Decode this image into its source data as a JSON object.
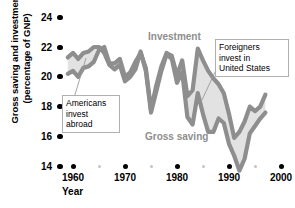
{
  "chart_data": {
    "type": "line",
    "title": "",
    "xlabel": "Year",
    "ylabel": "Gross saving and investment (percentage of GNP)",
    "xlim": [
      1958,
      2000
    ],
    "ylim": [
      14,
      24
    ],
    "yticks": [
      14,
      16,
      18,
      20,
      22,
      24
    ],
    "xticks": [
      1960,
      1970,
      1980,
      1990,
      2000
    ],
    "xticks_minor": [
      1965,
      1975,
      1985,
      1995
    ],
    "grid": false,
    "legend_position": "inline-annotations",
    "series": [
      {
        "name": "Investment",
        "color": "#8e8e8e",
        "x": [
          1959,
          1960,
          1961,
          1962,
          1963,
          1964,
          1965,
          1966,
          1967,
          1968,
          1969,
          1970,
          1971,
          1972,
          1973,
          1974,
          1975,
          1976,
          1977,
          1978,
          1979,
          1980,
          1981,
          1982,
          1983,
          1984,
          1985,
          1986,
          1987,
          1988,
          1989,
          1990,
          1991,
          1992,
          1993,
          1994,
          1995,
          1996,
          1997
        ],
        "values": [
          20.2,
          20.4,
          20.0,
          20.6,
          20.7,
          21.0,
          21.8,
          22.0,
          20.9,
          20.9,
          21.2,
          20.0,
          20.3,
          21.0,
          21.6,
          20.6,
          17.8,
          19.4,
          20.7,
          21.6,
          21.4,
          20.1,
          21.1,
          18.7,
          19.1,
          21.9,
          21.1,
          20.4,
          19.9,
          19.5,
          18.9,
          17.5,
          15.9,
          16.3,
          17.0,
          18.0,
          17.7,
          18.0,
          18.8
        ]
      },
      {
        "name": "Gross saving",
        "color": "#8e8e8e",
        "x": [
          1959,
          1960,
          1961,
          1962,
          1963,
          1964,
          1965,
          1966,
          1967,
          1968,
          1969,
          1970,
          1971,
          1972,
          1973,
          1974,
          1975,
          1976,
          1977,
          1978,
          1979,
          1980,
          1981,
          1982,
          1983,
          1984,
          1985,
          1986,
          1987,
          1988,
          1989,
          1990,
          1991,
          1992,
          1993,
          1994,
          1995,
          1996,
          1997
        ],
        "values": [
          21.3,
          21.6,
          21.2,
          21.6,
          21.7,
          22.0,
          22.0,
          21.6,
          20.8,
          20.5,
          20.8,
          19.7,
          20.0,
          20.5,
          21.7,
          20.4,
          17.6,
          19.0,
          20.4,
          21.5,
          21.2,
          19.6,
          20.3,
          17.3,
          16.8,
          18.9,
          17.5,
          16.3,
          16.3,
          17.2,
          16.9,
          15.5,
          14.7,
          13.7,
          14.5,
          16.2,
          16.7,
          17.2,
          17.6
        ]
      }
    ],
    "annotations": [
      {
        "id": "americans-invest-abroad",
        "lines": [
          "Americans",
          "invest",
          "abroad"
        ],
        "pointer_from": [
          74,
          98
        ],
        "pointer_to": [
          86,
          58
        ]
      },
      {
        "id": "foreigners-invest-in-united-states",
        "lines": [
          "Foreigners",
          "invest in",
          "United States"
        ],
        "pointer_from": [
          216,
          70
        ],
        "pointer_to": [
          201,
          102
        ]
      }
    ],
    "series_labels": [
      {
        "text": "Investment",
        "x": 148,
        "y": 31
      },
      {
        "text": "Gross saving",
        "x": 145,
        "y": 131
      }
    ]
  }
}
